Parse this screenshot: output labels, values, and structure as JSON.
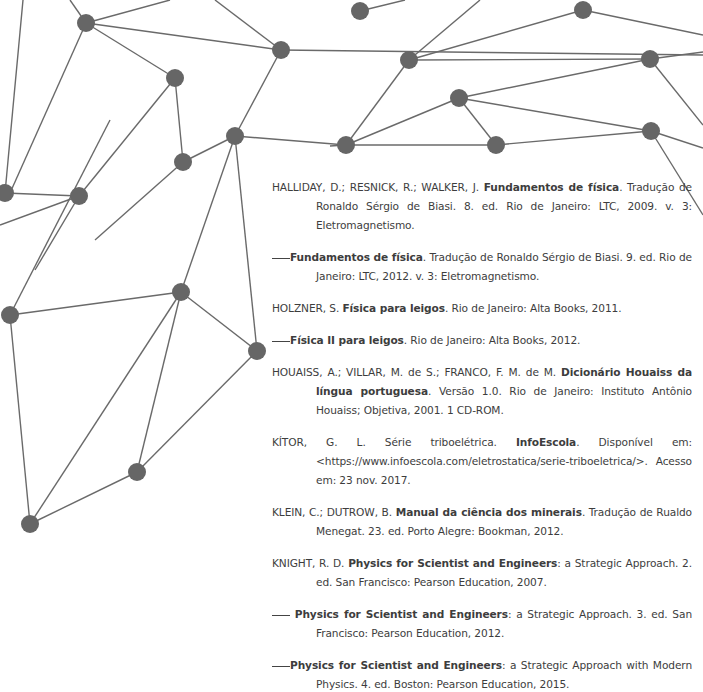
{
  "colors": {
    "text": "#3d3d3d",
    "node": "#666666",
    "edge": "#6a6a6a",
    "background": "#ffffff"
  },
  "network": {
    "nodes": [
      [
        86,
        23
      ],
      [
        360,
        11
      ],
      [
        583,
        10
      ],
      [
        281,
        50
      ],
      [
        409,
        60
      ],
      [
        650,
        59
      ],
      [
        175,
        78
      ],
      [
        459,
        98
      ],
      [
        235,
        136
      ],
      [
        183,
        162
      ],
      [
        346,
        145
      ],
      [
        496,
        145
      ],
      [
        651,
        131
      ],
      [
        5,
        193
      ],
      [
        79,
        196
      ],
      [
        181,
        292
      ],
      [
        10,
        315
      ],
      [
        257,
        351
      ],
      [
        137,
        472
      ],
      [
        30,
        524
      ]
    ]
  },
  "references": [
    {
      "lead": "HALLIDAY, D.; RESNICK, R.; WALKER, J. ",
      "title": "Fundamentos de física",
      "rest": ". Tradução de Ronaldo Sérgio de Biasi. 8. ed. Rio de Janeiro: LTC, 2009. v. 3: Eletromagnetismo."
    },
    {
      "lead": "",
      "dash": true,
      "title": "Fundamentos de física",
      "rest": ". Tradução de Ronaldo Sérgio de Biasi. 9. ed. Rio de Janeiro: LTC, 2012. v. 3: Eletromagnetismo."
    },
    {
      "lead": "HOLZNER, S. ",
      "title": "Física para leigos",
      "rest": ". Rio de Janeiro: Alta Books, 2011."
    },
    {
      "lead": "",
      "dash": true,
      "title": "Física II para leigos",
      "rest": ". Rio de Janeiro: Alta Books, 2012."
    },
    {
      "lead": "HOUAISS, A.; VILLAR, M. de S.; FRANCO, F. M. de M. ",
      "title": "Dicionário Houaiss da língua portuguesa",
      "rest": ". Versão 1.0. Rio de Janeiro: Instituto Antônio Houaiss; Objetiva, 2001. 1 CD-ROM."
    },
    {
      "lead": "KÍTOR, G. L. Série triboelétrica. ",
      "title": "InfoEscola",
      "rest": ". Disponível em: <https://www.infoescola.com/eletrostatica/serie-triboeletrica/>. Acesso em: 23 nov. 2017."
    },
    {
      "lead": "KLEIN, C.; DUTROW, B. ",
      "title": "Manual da ciência dos minerais",
      "rest": ". Tradução de Rualdo Menegat. 23. ed. Porto Alegre: Bookman, 2012."
    },
    {
      "lead": "KNIGHT, R. D. ",
      "title": "Physics for Scientist and Engineers",
      "rest": ": a Strategic Approach. 2. ed. San Francisco: Pearson Education, 2007."
    },
    {
      "lead": "",
      "dash": true,
      "title": "Physics for Scientist and Engineers",
      "rest": ": a Strategic Approach. 3. ed. San Francisco: Pearson Education, 2012."
    },
    {
      "lead": "",
      "dash": true,
      "title": "Physics for Scientist and Engineers",
      "rest": ": a Strategic Approach with Modern Physics. 4. ed. Boston: Pearson Education, 2015."
    }
  ]
}
